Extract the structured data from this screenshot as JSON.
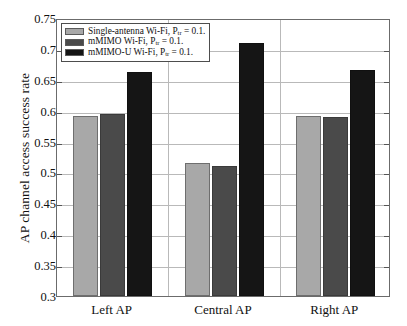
{
  "chart_data": {
    "type": "bar",
    "title": "",
    "xlabel": "",
    "ylabel": "AP channel access success rate",
    "categories": [
      "Left AP",
      "Central AP",
      "Right AP"
    ],
    "ylim": [
      0.3,
      0.75
    ],
    "yticks": [
      "0.3",
      "0.35",
      "0.4",
      "0.45",
      "0.5",
      "0.55",
      "0.6",
      "0.65",
      "0.7",
      "0.75"
    ],
    "ytick_values": [
      0.3,
      0.35,
      0.4,
      0.45,
      0.5,
      0.55,
      0.6,
      0.65,
      0.7,
      0.75
    ],
    "grid": true,
    "legend_position": "upper-left-inside",
    "series": [
      {
        "name": "Single-antenna Wi-Fi, P_tr = 0.1.",
        "label_main": "Single-antenna Wi-Fi, P",
        "label_sub": "tr",
        "label_tail": " = 0.1.",
        "color": "#a8a8a8",
        "values": [
          0.592,
          0.516,
          0.591
        ]
      },
      {
        "name": "mMIMO Wi-Fi, P_tr = 0.1.",
        "label_main": "mMIMO Wi-Fi, P",
        "label_sub": "tr",
        "label_tail": " = 0.1.",
        "color": "#4a4a4a",
        "values": [
          0.594,
          0.511,
          0.589
        ]
      },
      {
        "name": "mMIMO-U Wi-Fi, P_tr = 0.1.",
        "label_main": "mMIMO-U Wi-Fi, P",
        "label_sub": "tr",
        "label_tail": " = 0.1.",
        "color": "#151515",
        "values": [
          0.663,
          0.71,
          0.666
        ]
      }
    ]
  },
  "colors": {
    "series_light_gray": "#a8a8a8",
    "series_dark_gray": "#4a4a4a",
    "series_black": "#151515",
    "grid": "#b9b9b9",
    "axis": "#6b6b6b",
    "background": "#ffffff"
  }
}
